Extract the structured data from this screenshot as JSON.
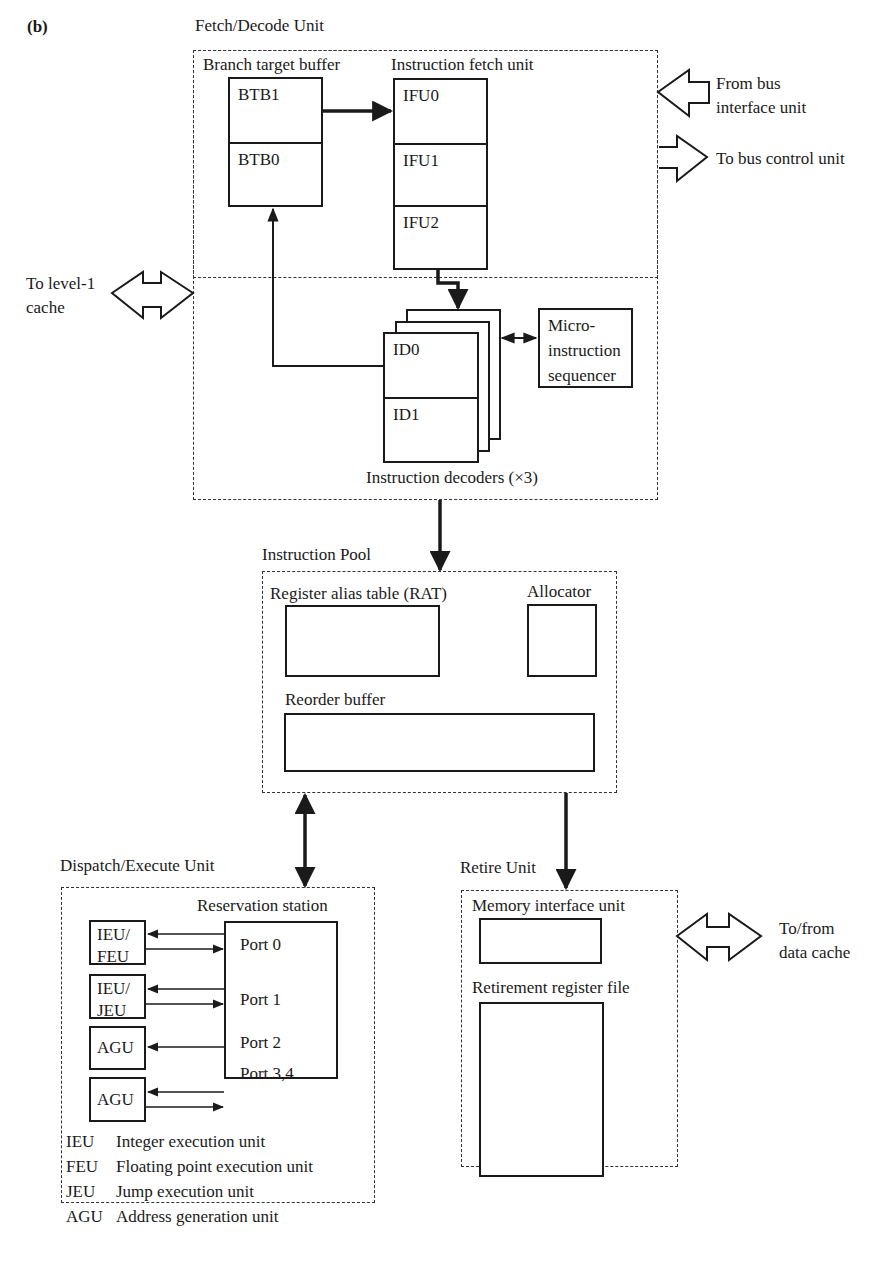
{
  "figure": {
    "panel_label": "(b)"
  },
  "fetch_decode_unit": {
    "title": "Fetch/Decode Unit",
    "branch_target_buffer": {
      "label": "Branch target buffer",
      "cells": [
        "BTB1",
        "BTB0"
      ]
    },
    "instruction_fetch_unit": {
      "label": "Instruction fetch unit",
      "cells": [
        "IFU0",
        "IFU1",
        "IFU2"
      ]
    },
    "instruction_decoders": {
      "label": "Instruction decoders (×3)",
      "cells": [
        "ID0",
        "ID1"
      ]
    },
    "microinstruction_sequencer": {
      "label": "Micro-\ninstruction\nsequencer"
    }
  },
  "external_connections": {
    "from_bus_interface": "From bus\ninterface unit",
    "to_bus_control": "To bus control unit",
    "to_level1_cache": "To level-1\ncache",
    "to_from_data_cache": "To/from\ndata cache"
  },
  "instruction_pool": {
    "title": "Instruction Pool",
    "rat_label": "Register alias table (RAT)",
    "allocator_label": "Allocator",
    "reorder_buffer_label": "Reorder buffer"
  },
  "dispatch_execute_unit": {
    "title": "Dispatch/Execute Unit",
    "reservation_station_label": "Reservation station",
    "ports": [
      "Port 0",
      "Port 1",
      "Port 2",
      "Port 3,4"
    ],
    "execution_units": [
      "IEU/\nFEU",
      "IEU/\nJEU",
      "AGU",
      "AGU"
    ],
    "legend": [
      {
        "abbr": "IEU",
        "desc": "Integer execution unit"
      },
      {
        "abbr": "FEU",
        "desc": "Floating point execution unit"
      },
      {
        "abbr": "JEU",
        "desc": "Jump execution unit"
      },
      {
        "abbr": "AGU",
        "desc": "Address generation unit"
      }
    ]
  },
  "retire_unit": {
    "title": "Retire Unit",
    "memory_interface_label": "Memory interface unit",
    "retirement_register_file_label": "Retirement register file"
  }
}
